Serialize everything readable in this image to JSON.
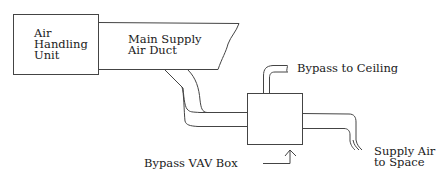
{
  "diagram": {
    "nodes": [
      {
        "id": "ahu",
        "label_lines": [
          "Air",
          "Handling",
          "Unit"
        ]
      },
      {
        "id": "main_duct",
        "label_lines": [
          "Main Supply",
          "Air Duct"
        ]
      },
      {
        "id": "vav_box",
        "label": "Bypass VAV Box"
      },
      {
        "id": "bypass",
        "label": "Bypass to Ceiling"
      },
      {
        "id": "supply_out",
        "label_lines": [
          "Supply Air",
          "to Space"
        ]
      }
    ],
    "edges": [
      {
        "from": "ahu",
        "to": "main_duct"
      },
      {
        "from": "main_duct",
        "to": "vav_box"
      },
      {
        "from": "vav_box",
        "to": "bypass"
      },
      {
        "from": "vav_box",
        "to": "supply_out"
      }
    ]
  }
}
